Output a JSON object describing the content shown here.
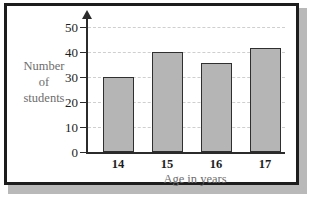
{
  "chart_data": {
    "type": "bar",
    "title": "",
    "subtitle": "",
    "xlabel": "Age in years",
    "ylabel": "Number of students",
    "ylabel_lines": [
      "Number",
      "of",
      "students"
    ],
    "categories": [
      "14",
      "15",
      "16",
      "17"
    ],
    "values": [
      30,
      40,
      35.5,
      41.5
    ],
    "series": [
      {
        "name": "Number of students",
        "values": [
          30,
          40,
          35.5,
          41.5
        ]
      }
    ],
    "ylim": [
      0,
      52
    ],
    "yticks": [
      "0",
      "10",
      "20",
      "30",
      "40",
      "50"
    ],
    "ytick_values": [
      0,
      10,
      20,
      30,
      40,
      50
    ],
    "xticks": [
      "14",
      "15",
      "16",
      "17"
    ],
    "grid": "horizontal-dashed",
    "legend": "none",
    "colors": {
      "bar_fill": "#b5b5b5",
      "bar_stroke": "#2f2f2f",
      "axis": "#2b2b2b",
      "gridline": "#cfcfcf",
      "tick_label": "#1d1d1d",
      "axis_title": "#6d6d6d",
      "frame": "#1d1d1d",
      "background": "#ffffff"
    },
    "axis_arrow_y": true
  }
}
